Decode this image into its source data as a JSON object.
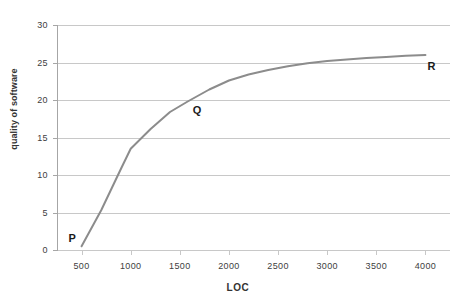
{
  "chart_data": {
    "type": "line",
    "title": "",
    "xlabel": "LOC",
    "ylabel": "quality of software",
    "xlim": [
      250,
      4250
    ],
    "ylim": [
      0,
      30
    ],
    "grid": true,
    "legend": false,
    "x_ticks": [
      500,
      1000,
      1500,
      2000,
      2500,
      3000,
      3500,
      4000
    ],
    "x_tick_labels": [
      "500",
      "1000",
      "1500",
      "2000",
      "2500",
      "3000",
      "3500",
      "4000"
    ],
    "y_ticks": [
      0,
      5,
      10,
      15,
      20,
      25,
      30
    ],
    "y_tick_labels": [
      "0",
      "5",
      "10",
      "15",
      "20",
      "25",
      "30"
    ],
    "series": [
      {
        "name": "quality of software",
        "color": "#8c8c8c",
        "x": [
          500,
          700,
          900,
          1000,
          1200,
          1400,
          1580,
          1800,
          2000,
          2200,
          2400,
          2600,
          2800,
          3000,
          3200,
          3400,
          3600,
          3800,
          4000
        ],
        "y": [
          0.5,
          5.3,
          10.8,
          13.5,
          16.1,
          18.4,
          19.8,
          21.4,
          22.6,
          23.4,
          24.0,
          24.5,
          24.9,
          25.2,
          25.4,
          25.6,
          25.75,
          25.9,
          26.0
        ]
      }
    ],
    "annotations": [
      {
        "label": "P",
        "x": 500,
        "y": 0.5,
        "name": "point-label-p"
      },
      {
        "label": "Q",
        "x": 1580,
        "y": 19.8,
        "name": "point-label-q"
      },
      {
        "label": "R",
        "x": 4000,
        "y": 26.0,
        "name": "point-label-r"
      }
    ]
  },
  "colors": {
    "series": "#8c8c8c",
    "gridline": "#c8c8c8",
    "axis": "#a6a6a6",
    "tick_text": "#404040",
    "title_text": "#333333",
    "background": "#ffffff"
  }
}
